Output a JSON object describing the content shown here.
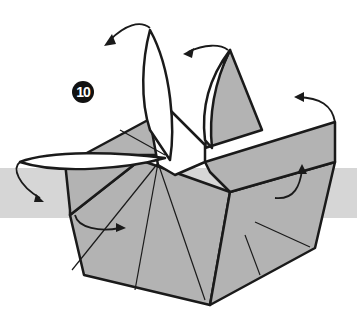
{
  "diagram": {
    "type": "origami-instruction",
    "step_number": "10",
    "background_band": {
      "color": "#d6d6d6",
      "top": 168,
      "height": 50
    },
    "paper_color": "#b3b3b3",
    "line_color": "#1a1a1a",
    "arrows": [
      {
        "name": "open-top-left-flap",
        "direction": "outward"
      },
      {
        "name": "open-top-center-flap",
        "direction": "outward"
      },
      {
        "name": "open-right-flap",
        "direction": "outward"
      },
      {
        "name": "open-left-flap",
        "direction": "down-left"
      },
      {
        "name": "fold-inner-left",
        "direction": "inward"
      },
      {
        "name": "fold-inner-right",
        "direction": "inward"
      }
    ]
  }
}
